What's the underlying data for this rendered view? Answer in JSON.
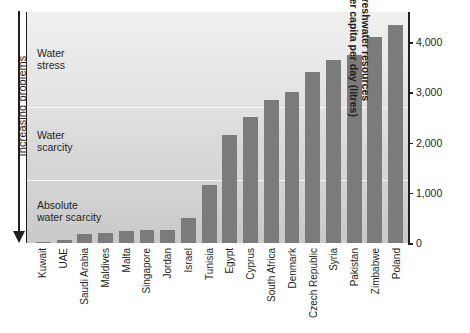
{
  "axis_note": {
    "label": "Increasing problems",
    "direction": "down"
  },
  "bands": [
    {
      "name": "water-stress",
      "label": "Water\nstress",
      "top_value": 4600,
      "bottom_value": 2700
    },
    {
      "name": "water-scarcity",
      "label": "Water\nscarcity",
      "top_value": 2700,
      "bottom_value": 1250
    },
    {
      "name": "absolute-water-scarcity",
      "label": "Absolute\nwater scarcity",
      "top_value": 1250,
      "bottom_value": 0
    }
  ],
  "yaxis": {
    "title": "Freshwater resources\nper capita per day (litres)",
    "ticks": [
      "0",
      "1,000",
      "2,000",
      "3,000",
      "4,000"
    ],
    "tick_values": [
      0,
      1000,
      2000,
      3000,
      4000
    ]
  },
  "chart_data": {
    "type": "bar",
    "title": "",
    "xlabel": "",
    "ylabel": "Freshwater resources per capita per day (litres)",
    "ylim": [
      0,
      4600
    ],
    "grid": false,
    "legend": "none",
    "bar_color": "#7b7b7b",
    "categories": [
      "Kuwait",
      "UAE",
      "Saudi Arabia",
      "Maldives",
      "Malta",
      "Singapore",
      "Jordan",
      "Israel",
      "Tunisia",
      "Egypt",
      "Cyprus",
      "South Africa",
      "Denmark",
      "Czech Republic",
      "Syria",
      "Pakistan",
      "Zimbabwe",
      "Poland"
    ],
    "values": [
      10,
      60,
      180,
      190,
      230,
      250,
      260,
      490,
      1150,
      2150,
      2500,
      2850,
      3000,
      3400,
      3650,
      3750,
      4100,
      4350
    ],
    "annotations": [
      {
        "text": "Water stress",
        "band_top": 4600,
        "band_bottom": 2700
      },
      {
        "text": "Water scarcity",
        "band_top": 2700,
        "band_bottom": 1250
      },
      {
        "text": "Absolute water scarcity",
        "band_top": 1250,
        "band_bottom": 0
      },
      {
        "text": "Increasing problems",
        "position": "left-axis-arrow-down"
      }
    ]
  }
}
